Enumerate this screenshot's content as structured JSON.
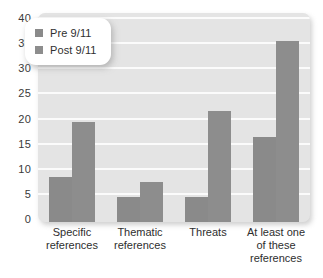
{
  "chart_data": {
    "type": "bar",
    "title": "",
    "xlabel": "",
    "ylabel": "",
    "ylim": [
      0,
      40
    ],
    "yticks": [
      40,
      35,
      30,
      25,
      20,
      15,
      10,
      5,
      0
    ],
    "grid": true,
    "legend_position": "upper-left-inside",
    "categories": [
      "Specific references",
      "Thematic references",
      "Threats",
      "At least one of these references"
    ],
    "category_lines": [
      [
        "Specific",
        "references"
      ],
      [
        "Thematic",
        "references"
      ],
      [
        "Threats"
      ],
      [
        "At least one",
        "of these",
        "references"
      ]
    ],
    "series": [
      {
        "name": "Pre 9/11",
        "color": "#8a8a8a",
        "values": [
          9,
          5,
          5,
          17
        ]
      },
      {
        "name": "Post 9/11",
        "color": "#8d8d8d",
        "values": [
          20,
          8,
          22,
          36
        ]
      }
    ]
  },
  "legend": {
    "entries": [
      {
        "label": "Pre 9/11"
      },
      {
        "label": "Post 9/11"
      }
    ]
  },
  "colors": {
    "panel_background": "#e4e4e4",
    "gridline": "#fbfbfb",
    "bar_pre": "#8a8a8a",
    "bar_post": "#8d8d8d",
    "text": "#2f2f2f",
    "page_background": "#ffffff"
  }
}
